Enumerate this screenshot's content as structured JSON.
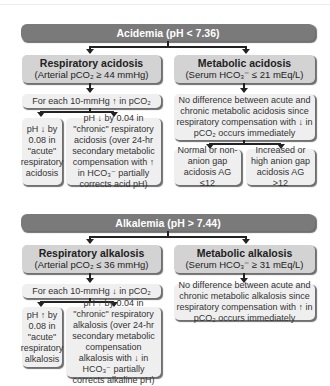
{
  "acidemia": {
    "header": "Acidemia (pH < 7.36)",
    "respiratory": {
      "title": "Respiratory acidosis",
      "criteria": "(Arterial pCO₂ ≥ 44 mmHg)",
      "step": "For each 10-mmHg ↑ in pCO₂",
      "acute": "pH ↓ by 0.08 in \"acute\" respiratory acidosis",
      "chronic": "pH ↓ by 0.04 in \"chronic\" respiratory acidosis (over 24-hr secondary metabolic compensation with ↑ in HCO₃⁻ partially corrects acid pH)"
    },
    "metabolic": {
      "title": "Metabolic acidosis",
      "criteria": "(Serum HCO₃⁻ ≤ 21 mEq/L)",
      "note": "No difference between acute and chronic metabolic acidosis since respiratory compensation with ↓ in pCO₂ occurs immediately",
      "normal_gap": "Normal or non-anion gap acidosis AG ≤12",
      "high_gap": "Increased or high anion gap acidosis AG >12"
    }
  },
  "alkalemia": {
    "header": "Alkalemia (pH > 7.44)",
    "respiratory": {
      "title": "Respiratory alkalosis",
      "criteria": "(Arterial pCO₂ ≤ 36 mmHg)",
      "step": "For each 10-mmHg ↓ in pCO₂",
      "acute": "pH ↑ by 0.08 in \"acute\" respiratory alkalosis",
      "chronic": "pH ↑ by 0.04 in \"chronic\" respiratory alkalosis (over 24-hr secondary metabolic compensation alkalosis with ↓ in HCO₃⁻ partially corrects alkaline pH)"
    },
    "metabolic": {
      "title": "Metabolic alkalosis",
      "criteria": "(Serum HCO₃⁻ ≥ 31 mEq/L)",
      "note": "No difference between acute and chronic metabolic alkalosis since respiratory compensation with ↑ in pCO₂ occurs immediately"
    }
  },
  "colors": {
    "header": "#7a7a7a",
    "category": "#d3d3d3",
    "detail": "#efefef",
    "connector": "#222222"
  }
}
